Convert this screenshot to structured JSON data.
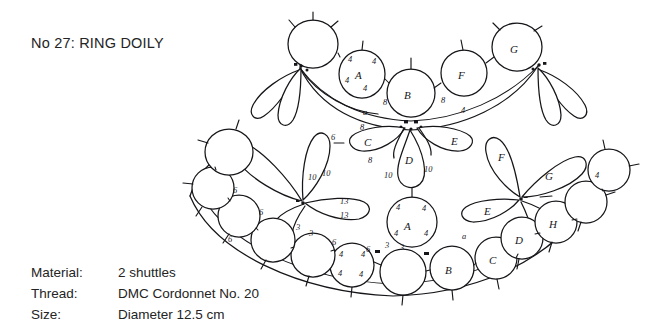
{
  "document": {
    "title": "No 27: RING DOILY"
  },
  "specs": {
    "rows": [
      {
        "label": "Material:",
        "value": "2 shuttles"
      },
      {
        "label": "Thread:",
        "value": "DMC Cordonnet No. 20"
      },
      {
        "label": "Size:",
        "value": "Diameter 12.5 cm"
      }
    ]
  },
  "diagram": {
    "name": "ring-doily-tatting-pattern",
    "ink_color": "#16161a",
    "paper_color": "#ffffff",
    "ring_labels": [
      "A",
      "B",
      "C",
      "D",
      "E",
      "F",
      "G",
      "H"
    ],
    "stitch_counts": [
      "3",
      "4",
      "6",
      "8",
      "10",
      "13"
    ],
    "marker_letters": [
      "a"
    ],
    "labels": {
      "upper_ring_A": "A",
      "upper_ring_B": "B",
      "upper_ring_F": "F",
      "upper_ring_G": "G",
      "upper_petal_C": "C",
      "upper_petal_D": "D",
      "upper_petal_E": "E",
      "lower_ring_A": "A",
      "lower_ring_B": "B",
      "lower_ring_C": "C",
      "lower_ring_D": "D",
      "lower_ring_H": "H",
      "lower_petal_E": "E",
      "lower_petal_F": "F",
      "lower_petal_G": "G"
    },
    "annotations": {
      "ring_A_upper_picots": [
        "4",
        "4",
        "4",
        "4"
      ],
      "ring_A_lower_picots": [
        "4",
        "4",
        "4",
        "4"
      ],
      "ring_4s_bottom_left": [
        "4",
        "4",
        "4",
        "4"
      ],
      "chain_8_left": "8",
      "chain_8_right": "8",
      "chain_8_petalC_top": "8",
      "chain_8_petalC_bottom": "8",
      "petal_D_left": "10",
      "petal_D_right": "10",
      "petal_left_10s": [
        "10",
        "10"
      ],
      "petal_13s": [
        "13",
        "13"
      ],
      "petal_6_left": "6",
      "chain_6_marks": [
        "6",
        "6",
        "6",
        "6",
        "6"
      ],
      "chain_3_marks": [
        "3",
        "3",
        "3",
        "3"
      ],
      "chain_4_right": "4",
      "chain_4_upper_right": "4",
      "marker_a_upper": "a",
      "marker_a_lower": "a"
    }
  }
}
